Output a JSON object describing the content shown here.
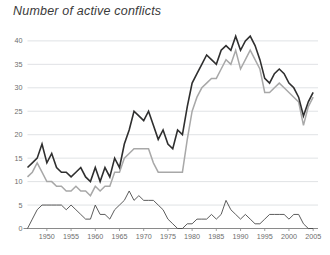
{
  "chart": {
    "title": "Number of active conflicts",
    "background_color": "#ffffff",
    "grid_color": "#d2d6da",
    "axis_color": "#8a8a8a",
    "tick_label_color": "#6d6d6d"
  },
  "chart_data": {
    "type": "line",
    "title": "Number of active conflicts",
    "xlabel": "",
    "ylabel": "",
    "xlim": [
      1946,
      2006
    ],
    "ylim": [
      0,
      42
    ],
    "yticks": [
      0,
      5,
      10,
      15,
      20,
      25,
      30,
      35,
      40
    ],
    "xticks": [
      1950,
      1955,
      1960,
      1965,
      1970,
      1975,
      1980,
      1985,
      1990,
      1995,
      2000,
      2005
    ],
    "grid": true,
    "grid_axis": "y",
    "legend": "none",
    "x": [
      1946,
      1947,
      1948,
      1949,
      1950,
      1951,
      1952,
      1953,
      1954,
      1955,
      1956,
      1957,
      1958,
      1959,
      1960,
      1961,
      1962,
      1963,
      1964,
      1965,
      1966,
      1967,
      1968,
      1969,
      1970,
      1971,
      1972,
      1973,
      1974,
      1975,
      1976,
      1977,
      1978,
      1979,
      1980,
      1981,
      1982,
      1983,
      1984,
      1985,
      1986,
      1987,
      1988,
      1989,
      1990,
      1991,
      1992,
      1993,
      1994,
      1995,
      1996,
      1997,
      1998,
      1999,
      2000,
      2001,
      2002,
      2003,
      2004,
      2005
    ],
    "series": [
      {
        "name": "total-conflicts",
        "color": "#2f2f2f",
        "width": 1.6,
        "values": [
          13,
          14,
          15,
          18,
          14,
          16,
          13,
          12,
          12,
          11,
          12,
          13,
          11,
          10,
          13,
          10,
          13,
          11,
          15,
          13,
          18,
          21,
          25,
          24,
          23,
          25,
          22,
          19,
          21,
          18,
          17,
          21,
          20,
          26,
          31,
          33,
          35,
          37,
          36,
          35,
          38,
          39,
          38,
          41,
          38,
          40,
          41,
          39,
          36,
          32,
          31,
          33,
          34,
          33,
          31,
          30,
          28,
          24,
          27,
          29
        ]
      },
      {
        "name": "internal-conflicts",
        "color": "#a8a8a8",
        "width": 1.5,
        "values": [
          11,
          12,
          14,
          12,
          10,
          10,
          9,
          9,
          8,
          8,
          9,
          8,
          8,
          7,
          9,
          8,
          9,
          9,
          12,
          12,
          15,
          16,
          17,
          17,
          17,
          17,
          14,
          12,
          12,
          12,
          12,
          12,
          12,
          19,
          25,
          28,
          30,
          31,
          32,
          32,
          34,
          36,
          35,
          38,
          34,
          36,
          38,
          36,
          34,
          29,
          29,
          30,
          31,
          30,
          29,
          28,
          27,
          22,
          26,
          28
        ]
      },
      {
        "name": "internationalized-conflicts",
        "color": "#4a4a4a",
        "width": 0.9,
        "values": [
          0,
          2,
          4,
          5,
          5,
          5,
          5,
          5,
          4,
          5,
          4,
          3,
          2,
          2,
          5,
          3,
          3,
          2,
          4,
          5,
          6,
          8,
          6,
          7,
          6,
          6,
          6,
          5,
          4,
          2,
          1,
          0,
          0,
          1,
          1,
          2,
          2,
          2,
          3,
          2,
          3,
          6,
          4,
          3,
          2,
          3,
          2,
          1,
          1,
          2,
          3,
          3,
          3,
          3,
          2,
          3,
          3,
          1,
          0,
          0
        ]
      }
    ]
  }
}
